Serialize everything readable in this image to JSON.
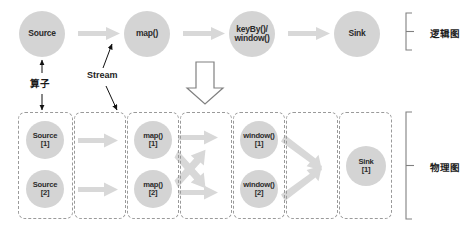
{
  "figure": {
    "colors": {
      "node_fill": "#d4d4d4",
      "arrow_fill": "#d8d8d8",
      "dashed_border": "#9a9a9a",
      "text": "#1d1d1d",
      "background": "#ffffff"
    }
  },
  "logical_graph": {
    "bracket_label": "逻辑图",
    "nodes": [
      {
        "id": "source",
        "lines": [
          "Source"
        ]
      },
      {
        "id": "map",
        "lines": [
          "map()"
        ]
      },
      {
        "id": "keyby-window",
        "lines": [
          "keyBy()/",
          "window()"
        ]
      },
      {
        "id": "sink",
        "lines": [
          "Sink"
        ]
      }
    ]
  },
  "annotations": {
    "operator_label": "算子",
    "stream_label": "Stream"
  },
  "physical_graph": {
    "bracket_label": "物理图",
    "stages": [
      {
        "id": "source-stage",
        "nodes": [
          {
            "lines": [
              "Source",
              "[1]"
            ]
          },
          {
            "lines": [
              "Source",
              "[2]"
            ]
          }
        ]
      },
      {
        "id": "source-to-map-stream",
        "nodes": []
      },
      {
        "id": "map-stage",
        "nodes": [
          {
            "lines": [
              "map()",
              "[1]"
            ]
          },
          {
            "lines": [
              "map()",
              "[2]"
            ]
          }
        ]
      },
      {
        "id": "map-to-window-stream",
        "nodes": []
      },
      {
        "id": "window-stage",
        "nodes": [
          {
            "lines": [
              "window()",
              "[1]"
            ]
          },
          {
            "lines": [
              "window()",
              "[2]"
            ]
          }
        ]
      },
      {
        "id": "window-to-sink-stream",
        "nodes": []
      },
      {
        "id": "sink-stage",
        "nodes": [
          {
            "lines": [
              "Sink",
              "[1]"
            ]
          }
        ]
      }
    ]
  }
}
